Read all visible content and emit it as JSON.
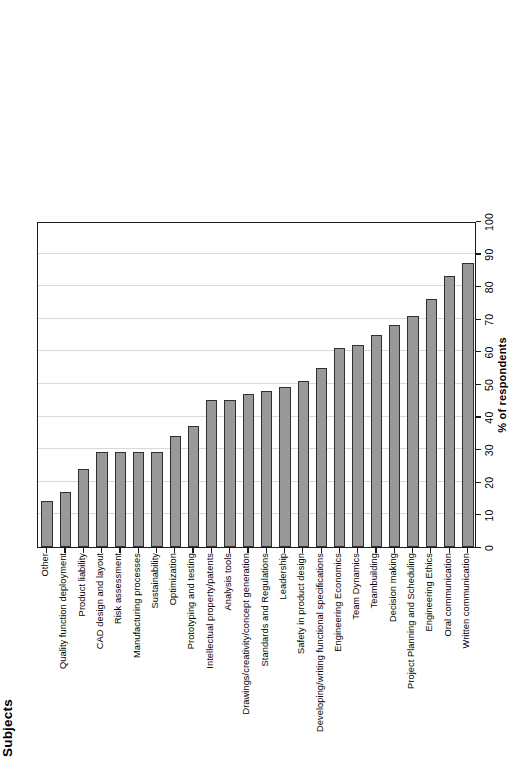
{
  "chart_data": {
    "type": "bar",
    "orientation": "vertical",
    "title": "",
    "xlabel": "Subjects",
    "ylabel": "% of respondents",
    "ylim": [
      0,
      100
    ],
    "yticks": [
      0,
      10,
      20,
      30,
      40,
      50,
      60,
      70,
      80,
      90,
      100
    ],
    "grid": true,
    "legend": false,
    "bar_color": "#999999",
    "bar_edge_color": "#303030",
    "grid_color": "#d9d9d9",
    "categories": [
      "Other",
      "Quality function deployment",
      "Product liability",
      "CAD design and layout",
      "Risk assessment",
      "Manufacturing processes",
      "Sustainability",
      "Optimization",
      "Prototyping and testing",
      "Intellectual property/patents",
      "Analysis tools",
      "Drawings/creativity/concept generation",
      "Standards and Regulations",
      "Leadership",
      "Safety in product design",
      "Developing/writing functional specifications",
      "Engineering Economics",
      "Team Dynamics",
      "Teambuilding",
      "Decision making",
      "Project Planning and Scheduling",
      "Engineering Ethics",
      "Oral communication",
      "Written communication"
    ],
    "values": [
      14,
      17,
      24,
      29,
      29,
      29,
      29,
      34,
      37,
      45,
      45,
      47,
      48,
      49,
      51,
      55,
      61,
      62,
      65,
      68,
      71,
      76,
      83,
      87
    ]
  },
  "axes": {
    "category_axis_title": "Subjects",
    "value_axis_title": "% of respondents"
  }
}
